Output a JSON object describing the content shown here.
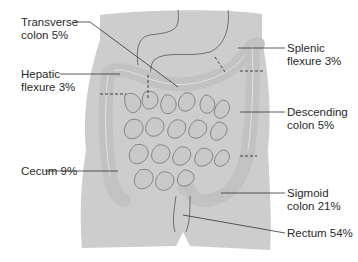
{
  "figure": {
    "type": "anatomical-diagram",
    "colors": {
      "body": "#cdcdcd",
      "outline": "#555555",
      "bowel": "#c2c2c2",
      "highlight": "#e2e2e2",
      "leader": "#333333",
      "text": "#2a2a2a"
    }
  },
  "labels": [
    {
      "id": "transverse-colon",
      "line1": "Transverse",
      "line2": "colon 5%",
      "percent": 5
    },
    {
      "id": "hepatic-flexure",
      "line1": "Hepatic",
      "line2": "flexure 3%",
      "percent": 3
    },
    {
      "id": "cecum",
      "line1": "Cecum 9%",
      "line2": "",
      "percent": 9
    },
    {
      "id": "splenic-flexure",
      "line1": "Splenic",
      "line2": "flexure 3%",
      "percent": 3
    },
    {
      "id": "descending-colon",
      "line1": "Descending",
      "line2": "colon 5%",
      "percent": 5
    },
    {
      "id": "sigmoid-colon",
      "line1": "Sigmoid",
      "line2": "colon 21%",
      "percent": 21
    },
    {
      "id": "rectum",
      "line1": "Rectum 54%",
      "line2": "",
      "percent": 54
    }
  ]
}
